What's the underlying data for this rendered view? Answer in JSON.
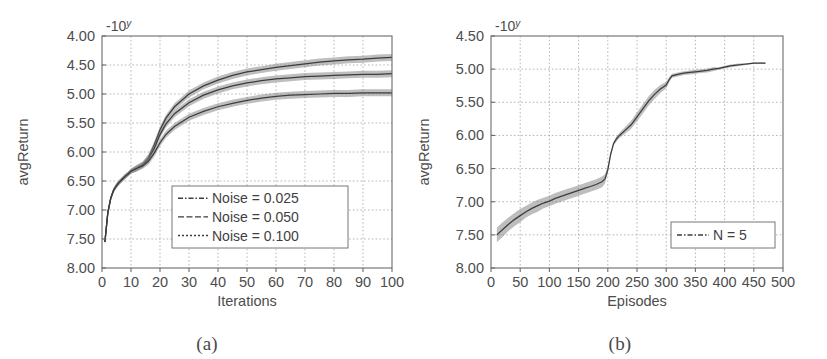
{
  "figure": {
    "panels": [
      {
        "id": "a",
        "subcaption": "(a)",
        "exponent_label": "-10",
        "exponent_sup": "y"
      },
      {
        "id": "b",
        "subcaption": "(b)",
        "exponent_label": "-10",
        "exponent_sup": "y"
      }
    ]
  },
  "chart_data": [
    {
      "type": "line",
      "panel": "a",
      "title": "",
      "xlabel": "Iterations",
      "ylabel": "avgReturn",
      "y_scale_note": "-10^y",
      "xlim": [
        0,
        100
      ],
      "ylim": [
        8.0,
        4.0
      ],
      "y_axis_inverted": true,
      "grid": true,
      "xticks": [
        0,
        10,
        20,
        30,
        40,
        50,
        60,
        70,
        80,
        90,
        100
      ],
      "xtick_labels": [
        "0",
        "10",
        "20",
        "30",
        "40",
        "50",
        "60",
        "70",
        "80",
        "90",
        "100"
      ],
      "yticks": [
        4.0,
        4.5,
        5.0,
        5.5,
        6.0,
        6.5,
        7.0,
        7.5,
        8.0
      ],
      "ytick_labels": [
        "4.00",
        "4.50",
        "5.00",
        "5.50",
        "6.00",
        "6.50",
        "7.00",
        "7.50",
        "8.00"
      ],
      "legend_position": "lower center-right",
      "legend_entries": [
        "Noise = 0.025",
        "Noise = 0.050",
        "Noise = 0.100"
      ],
      "x": [
        1,
        2,
        3,
        4,
        5,
        6,
        7,
        8,
        9,
        10,
        12,
        14,
        16,
        18,
        20,
        22,
        25,
        30,
        35,
        40,
        45,
        50,
        55,
        60,
        65,
        70,
        75,
        80,
        85,
        90,
        95,
        100
      ],
      "series": [
        {
          "name": "Noise = 0.025",
          "values": [
            7.55,
            7.05,
            6.8,
            6.66,
            6.58,
            6.52,
            6.47,
            6.42,
            6.38,
            6.33,
            6.28,
            6.22,
            6.1,
            5.88,
            5.62,
            5.42,
            5.22,
            5.0,
            4.86,
            4.76,
            4.68,
            4.62,
            4.58,
            4.54,
            4.51,
            4.48,
            4.45,
            4.43,
            4.41,
            4.4,
            4.38,
            4.37
          ],
          "band_half_width": [
            0.04,
            0.04,
            0.04,
            0.04,
            0.04,
            0.04,
            0.04,
            0.04,
            0.04,
            0.04,
            0.05,
            0.05,
            0.06,
            0.06,
            0.06,
            0.06,
            0.06,
            0.06,
            0.06,
            0.06,
            0.06,
            0.06,
            0.06,
            0.06,
            0.06,
            0.06,
            0.06,
            0.06,
            0.06,
            0.06,
            0.06,
            0.06
          ]
        },
        {
          "name": "Noise = 0.050",
          "values": [
            7.55,
            7.05,
            6.8,
            6.66,
            6.58,
            6.52,
            6.47,
            6.42,
            6.38,
            6.33,
            6.28,
            6.22,
            6.12,
            5.94,
            5.7,
            5.52,
            5.34,
            5.15,
            5.02,
            4.93,
            4.86,
            4.81,
            4.77,
            4.74,
            4.72,
            4.7,
            4.69,
            4.68,
            4.67,
            4.66,
            4.66,
            4.65
          ],
          "band_half_width": [
            0.04,
            0.04,
            0.04,
            0.04,
            0.04,
            0.04,
            0.04,
            0.04,
            0.04,
            0.04,
            0.05,
            0.05,
            0.06,
            0.06,
            0.06,
            0.06,
            0.06,
            0.06,
            0.06,
            0.06,
            0.06,
            0.06,
            0.06,
            0.06,
            0.06,
            0.06,
            0.06,
            0.06,
            0.06,
            0.06,
            0.06,
            0.06
          ]
        },
        {
          "name": "Noise = 0.100",
          "values": [
            7.55,
            7.05,
            6.8,
            6.66,
            6.58,
            6.52,
            6.47,
            6.42,
            6.38,
            6.33,
            6.28,
            6.24,
            6.16,
            6.02,
            5.84,
            5.7,
            5.56,
            5.4,
            5.3,
            5.22,
            5.16,
            5.11,
            5.07,
            5.04,
            5.02,
            5.01,
            5.0,
            4.99,
            4.99,
            4.98,
            4.98,
            4.98
          ],
          "band_half_width": [
            0.04,
            0.04,
            0.04,
            0.04,
            0.04,
            0.04,
            0.04,
            0.04,
            0.04,
            0.04,
            0.05,
            0.05,
            0.06,
            0.06,
            0.06,
            0.06,
            0.06,
            0.06,
            0.06,
            0.06,
            0.06,
            0.06,
            0.06,
            0.06,
            0.06,
            0.06,
            0.06,
            0.06,
            0.06,
            0.06,
            0.06,
            0.06
          ]
        }
      ]
    },
    {
      "type": "line",
      "panel": "b",
      "title": "",
      "xlabel": "Episodes",
      "ylabel": "avgReturn",
      "y_scale_note": "-10^y",
      "xlim": [
        0,
        500
      ],
      "ylim": [
        8.0,
        4.5
      ],
      "y_axis_inverted": true,
      "grid": true,
      "xticks": [
        0,
        50,
        100,
        150,
        200,
        250,
        300,
        350,
        400,
        450,
        500
      ],
      "xtick_labels": [
        "0",
        "50",
        "100",
        "150",
        "200",
        "250",
        "300",
        "350",
        "400",
        "450",
        "500"
      ],
      "yticks": [
        4.5,
        5.0,
        5.5,
        6.0,
        6.5,
        7.0,
        7.5,
        8.0
      ],
      "ytick_labels": [
        "4.50",
        "5.00",
        "5.50",
        "6.00",
        "6.50",
        "7.00",
        "7.50",
        "8.00"
      ],
      "legend_position": "lower right",
      "legend_entries": [
        "N = 5"
      ],
      "x": [
        10,
        20,
        30,
        40,
        50,
        60,
        70,
        80,
        90,
        100,
        110,
        120,
        130,
        140,
        150,
        160,
        170,
        180,
        190,
        195,
        200,
        205,
        210,
        215,
        220,
        230,
        240,
        250,
        260,
        270,
        280,
        290,
        300,
        305,
        310,
        320,
        330,
        340,
        350,
        360,
        370,
        380,
        390,
        400,
        410,
        420,
        430,
        440,
        450,
        460,
        470
      ],
      "series": [
        {
          "name": "N = 5",
          "values": [
            7.5,
            7.42,
            7.34,
            7.27,
            7.21,
            7.15,
            7.1,
            7.06,
            7.02,
            6.99,
            6.95,
            6.92,
            6.89,
            6.86,
            6.83,
            6.8,
            6.77,
            6.74,
            6.7,
            6.66,
            6.52,
            6.28,
            6.12,
            6.05,
            6.0,
            5.92,
            5.84,
            5.72,
            5.6,
            5.48,
            5.38,
            5.3,
            5.24,
            5.16,
            5.1,
            5.08,
            5.06,
            5.05,
            5.04,
            5.03,
            5.02,
            5.0,
            4.99,
            4.97,
            4.95,
            4.94,
            4.93,
            4.92,
            4.91,
            4.91,
            4.91
          ],
          "band_half_width": [
            0.11,
            0.11,
            0.1,
            0.1,
            0.1,
            0.09,
            0.09,
            0.09,
            0.08,
            0.08,
            0.08,
            0.08,
            0.08,
            0.08,
            0.08,
            0.08,
            0.08,
            0.08,
            0.08,
            0.07,
            0.05,
            0.03,
            0.03,
            0.04,
            0.04,
            0.05,
            0.06,
            0.07,
            0.07,
            0.07,
            0.07,
            0.06,
            0.05,
            0.04,
            0.03,
            0.03,
            0.03,
            0.03,
            0.03,
            0.03,
            0.03,
            0.03,
            0.02,
            0.02,
            0.02,
            0.02,
            0.02,
            0.01,
            0.01,
            0.01,
            0.01
          ]
        }
      ]
    }
  ]
}
